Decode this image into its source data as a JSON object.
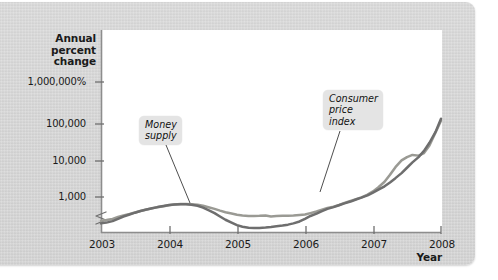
{
  "chart_data": {
    "type": "line",
    "title": "",
    "subtitle": "",
    "ylabel": "Annual percent change",
    "xlabel": "Year",
    "y_scale": "log",
    "y_axis_break": true,
    "grid": false,
    "legend_position": "inline-callouts",
    "y_tick_labels": [
      "1,000,000%",
      "100,000",
      "10,000",
      "1,000"
    ],
    "y_tick_values": [
      1000000,
      100000,
      10000,
      1000
    ],
    "x_tick_labels": [
      "2003",
      "2004",
      "2005",
      "2006",
      "2007",
      "2008"
    ],
    "x_tick_values": [
      2003,
      2004,
      2005,
      2006,
      2007,
      2008
    ],
    "xlim": [
      2003,
      2008
    ],
    "ylim": [
      100,
      1000000
    ],
    "annotations": [
      {
        "text_lines": [
          "Money",
          "supply"
        ],
        "series": "Money supply"
      },
      {
        "text_lines": [
          "Consumer",
          "price",
          "index"
        ],
        "series": "Consumer price index"
      }
    ],
    "series": [
      {
        "name": "Money supply",
        "color": "#9a9a94",
        "x": [
          2003.0,
          2003.08,
          2003.17,
          2003.25,
          2003.33,
          2003.42,
          2003.5,
          2003.58,
          2003.67,
          2003.75,
          2003.83,
          2003.92,
          2004.0,
          2004.08,
          2004.17,
          2004.25,
          2004.33,
          2004.42,
          2004.5,
          2004.58,
          2004.67,
          2004.75,
          2004.83,
          2004.92,
          2005.0,
          2005.08,
          2005.17,
          2005.25,
          2005.33,
          2005.42,
          2005.5,
          2005.58,
          2005.67,
          2005.75,
          2005.83,
          2005.92,
          2006.0,
          2006.08,
          2006.17,
          2006.25,
          2006.33,
          2006.42,
          2006.5,
          2006.58,
          2006.67,
          2006.75,
          2006.83,
          2006.92,
          2007.0,
          2007.08,
          2007.17,
          2007.25,
          2007.33,
          2007.42,
          2007.5,
          2007.58,
          2007.67,
          2007.75,
          2007.83,
          2007.92,
          2008.0
        ],
        "values": [
          240,
          250,
          268,
          300,
          330,
          360,
          395,
          430,
          470,
          505,
          540,
          575,
          610,
          640,
          655,
          660,
          650,
          625,
          590,
          540,
          490,
          440,
          400,
          370,
          345,
          330,
          320,
          318,
          322,
          330,
          310,
          318,
          322,
          325,
          330,
          340,
          350,
          380,
          420,
          470,
          520,
          560,
          620,
          700,
          790,
          880,
          980,
          1150,
          1400,
          1800,
          2500,
          3800,
          6000,
          9000,
          11000,
          12500,
          12000,
          14000,
          22000,
          48000,
          98000
        ]
      },
      {
        "name": "Consumer price index",
        "color": "#6e6e6e",
        "x": [
          2003.0,
          2003.08,
          2003.17,
          2003.25,
          2003.33,
          2003.42,
          2003.5,
          2003.58,
          2003.67,
          2003.75,
          2003.83,
          2003.92,
          2004.0,
          2004.08,
          2004.17,
          2004.25,
          2004.33,
          2004.42,
          2004.5,
          2004.58,
          2004.67,
          2004.75,
          2004.83,
          2004.92,
          2005.0,
          2005.08,
          2005.17,
          2005.25,
          2005.33,
          2005.42,
          2005.5,
          2005.58,
          2005.67,
          2005.75,
          2005.83,
          2005.92,
          2006.0,
          2006.08,
          2006.17,
          2006.25,
          2006.33,
          2006.42,
          2006.5,
          2006.58,
          2006.67,
          2006.75,
          2006.83,
          2006.92,
          2007.0,
          2007.08,
          2007.17,
          2007.25,
          2007.33,
          2007.42,
          2007.5,
          2007.58,
          2007.67,
          2007.75,
          2007.83,
          2007.92,
          2008.0
        ],
        "values": [
          205,
          215,
          235,
          270,
          310,
          350,
          390,
          430,
          470,
          510,
          545,
          580,
          615,
          640,
          650,
          650,
          630,
          590,
          530,
          455,
          380,
          310,
          255,
          215,
          185,
          168,
          158,
          155,
          156,
          160,
          165,
          172,
          180,
          190,
          205,
          230,
          270,
          320,
          370,
          430,
          490,
          545,
          610,
          680,
          760,
          860,
          960,
          1100,
          1300,
          1550,
          1900,
          2400,
          3100,
          4200,
          5800,
          8000,
          11000,
          16000,
          26000,
          50000,
          110000
        ]
      }
    ]
  },
  "axis": {
    "y_title_lines": [
      "Annual",
      "percent",
      "change"
    ],
    "x_title": "Year"
  }
}
